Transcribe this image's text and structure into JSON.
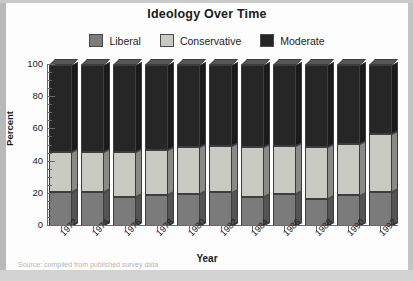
{
  "page": {
    "title": "Ideology Over Time"
  },
  "legend": {
    "position": "top",
    "items": [
      {
        "label": "Liberal",
        "color": "#7b7b7b"
      },
      {
        "label": "Conservative",
        "color": "#cacac4"
      },
      {
        "label": "Moderate",
        "color": "#262626"
      }
    ]
  },
  "axes": {
    "y_title": "Percent",
    "x_title": "Year",
    "y_ticks": [
      "0",
      "20",
      "40",
      "60",
      "80",
      "100"
    ],
    "y_minor_step": 5
  },
  "chart_data": {
    "type": "bar",
    "title": "Ideology Over Time",
    "xlabel": "Year",
    "ylabel": "Percent",
    "ylim": [
      0,
      100
    ],
    "stacked": true,
    "grid": false,
    "legend_position": "top",
    "categories": [
      "1972",
      "1974",
      "1976",
      "1978",
      "1980",
      "1982",
      "1984",
      "1986",
      "1988",
      "1990",
      "1992"
    ],
    "series": [
      {
        "name": "Liberal",
        "color": "#7b7b7b",
        "values": [
          21,
          21,
          18,
          19,
          20,
          21,
          18,
          20,
          17,
          19,
          21
        ]
      },
      {
        "name": "Conservative",
        "color": "#cacac4",
        "values": [
          25,
          25,
          28,
          28,
          29,
          29,
          31,
          30,
          32,
          32,
          36
        ]
      },
      {
        "name": "Moderate",
        "color": "#262626",
        "values": [
          54,
          54,
          54,
          53,
          51,
          50,
          51,
          50,
          51,
          49,
          43
        ]
      }
    ]
  },
  "footer": {
    "caption_fragment": "Source: compiled from published survey data"
  }
}
